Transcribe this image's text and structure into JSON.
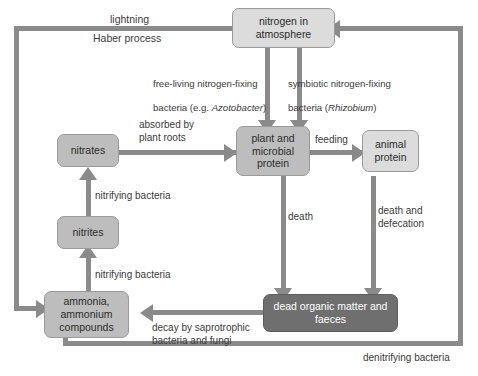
{
  "diagram": {
    "colors": {
      "line": "#8a8a8a",
      "box_light": "#dcdcdc",
      "box_mid": "#bdbdbd",
      "box_dark": "#6f6f6f",
      "box_border": "#9a9a9a",
      "text": "#2b2b2b",
      "text_dark_box": "#ffffff",
      "background": "#ffffff"
    },
    "nodes": {
      "nitrogen_atmosphere": "nitrogen in\natmosphere",
      "nitrates": "nitrates",
      "nitrites": "nitrites",
      "ammonia": "ammonia,\nammonium\ncompounds",
      "plant_protein": "plant and\nmicrobial\nprotein",
      "animal_protein": "animal\nprotein",
      "dead_organic_matter": "dead organic matter\nand faeces"
    },
    "labels": {
      "lightning": "lightning",
      "haber_process": "Haber process",
      "free_living_line1": "free-living nitrogen-fixing",
      "free_living_line2_pre": "bacteria (e.g. ",
      "free_living_line2_italic": "Azotobacter",
      "free_living_line2_post": ")",
      "symbiotic_line1": "symbiotic nitrogen-fixing",
      "symbiotic_line2_pre": "bacteria (",
      "symbiotic_line2_italic": "Rhizobium",
      "symbiotic_line2_post": ")",
      "absorbed_by_plant_roots": "absorbed by\nplant roots",
      "feeding": "feeding",
      "death": "death",
      "death_and_defecation": "death and\ndefecation",
      "nitrifying_bacteria_upper": "nitrifying bacteria",
      "nitrifying_bacteria_lower": "nitrifying bacteria",
      "decay_saprotrophic": "decay by saprotrophic\nbacteria and fungi",
      "denitrifying_bacteria": "denitrifying bacteria"
    }
  }
}
